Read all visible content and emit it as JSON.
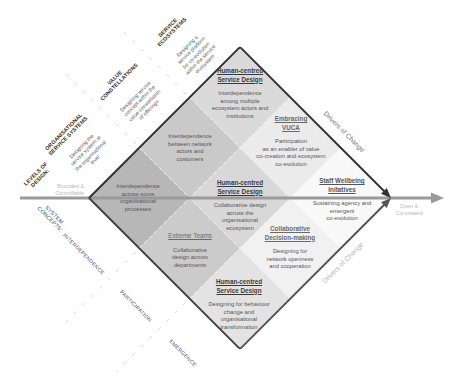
{
  "diagram": {
    "levels_title_lines": [
      "LEVELS OF",
      "DESIGN:"
    ],
    "levels": [
      {
        "title_lines": [
          "ORGANISATIONAL",
          "SERVICE SYSTEMS"
        ],
        "desc_lines": [
          "Designing the",
          "service system at",
          "the organisational",
          "level"
        ]
      },
      {
        "title_lines": [
          "VALUE",
          "CONSTELLATIONS"
        ],
        "desc_lines": [
          "Designing service",
          "concept within the",
          "value constellation",
          "of offerings"
        ]
      },
      {
        "title_lines": [
          "SERVICE",
          "ECOSYSTEMS"
        ],
        "desc_lines": [
          "Designing a",
          "service platform",
          "for co-evolution",
          "within the service",
          "ecosystem"
        ]
      }
    ],
    "concepts_title_lines": [
      "SYSTEM",
      "CONCEPTS:"
    ],
    "concepts": [
      "INTERDEPENDENCE",
      "PARTICIPATION",
      "EMERGENCE"
    ],
    "axis": {
      "left_label_lines": [
        "Bounded &",
        "Controllable"
      ],
      "right_label_lines": [
        "Open &",
        "Co-created"
      ],
      "color": "#9a9a9a"
    },
    "drivers": {
      "top": "Drivers of Change",
      "bottom": "Drivers of Change",
      "top_color": "#777777",
      "bottom_color": "#b5b5b5"
    },
    "cells": [
      {
        "position": "left",
        "fill": "#b7b7b7",
        "heading_lines": [],
        "body_lines": [
          "Interdependence",
          "across some",
          "organisational",
          "processes"
        ]
      },
      {
        "position": "upper-left",
        "fill": "#c9c9c9",
        "heading_lines": [],
        "body_lines": [
          "Interdependence",
          "between network",
          "actors and",
          "customers"
        ]
      },
      {
        "position": "top",
        "fill": "#dadada",
        "heading_lines": [
          "Human-centred",
          "Service Design"
        ],
        "body_lines": [
          "Interdependence",
          "among multiple",
          "ecosystem actors and",
          "institutions"
        ]
      },
      {
        "position": "lower-left",
        "fill": "#cbcbcb",
        "heading_lines": [
          "Extreme Teams"
        ],
        "body_lines": [
          "Collaborative",
          "design across",
          "departments"
        ]
      },
      {
        "position": "center",
        "fill": "#d8d8d8",
        "heading_lines": [
          "Human-centred",
          "Service Design"
        ],
        "body_lines": [
          "Collaborative design",
          "across the",
          "organisational",
          "ecosystem"
        ]
      },
      {
        "position": "upper-right",
        "fill": "#ebebeb",
        "heading_lines": [
          "Embracing",
          "VUCA"
        ],
        "body_lines": [
          "Participation",
          "as an enabler of value",
          "co-creation and ecosystem",
          "co-evolution"
        ]
      },
      {
        "position": "bottom",
        "fill": "#e3e3e3",
        "heading_lines": [
          "Human-centred",
          "Service Design"
        ],
        "body_lines": [
          "Designing for behaviour",
          "change and",
          "organisational",
          "transformation"
        ]
      },
      {
        "position": "lower-right",
        "fill": "#f1f1f1",
        "heading_lines": [
          "Collaborative",
          "Decision-making"
        ],
        "body_lines": [
          "Designing for",
          "network openness",
          "and cooperation"
        ]
      },
      {
        "position": "right",
        "fill": "#f9f9f9",
        "heading_lines": [
          "Staff Wellbeing",
          "Initatives"
        ],
        "body_lines": [
          "Sustaining agency and",
          "emergent",
          "co-evolution"
        ]
      }
    ]
  }
}
